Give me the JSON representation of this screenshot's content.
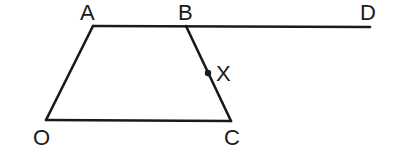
{
  "diagram": {
    "points": {
      "A": {
        "label": "A",
        "x": 93,
        "y": 26
      },
      "B": {
        "label": "B",
        "x": 186,
        "y": 26
      },
      "D": {
        "label": "D",
        "x": 370,
        "y": 27
      },
      "O": {
        "label": "O",
        "x": 46,
        "y": 120
      },
      "C": {
        "label": "C",
        "x": 231,
        "y": 121
      },
      "X": {
        "label": "X",
        "x": 207,
        "y": 73
      }
    },
    "segments": [
      "AD",
      "OA",
      "OC",
      "BC"
    ],
    "labels": {
      "A": "A",
      "B": "B",
      "D": "D",
      "X": "X",
      "O": "O",
      "C": "C"
    }
  }
}
